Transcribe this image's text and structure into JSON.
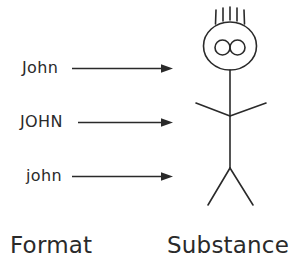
{
  "figure": {
    "title": "",
    "background_color": "#ffffff",
    "ink_color": "#2a2a2a",
    "format_column": {
      "axis_label": "Format",
      "entries": [
        {
          "text": "John",
          "style_note": "mixed-case"
        },
        {
          "text": "JOHN",
          "style_note": "upper-case"
        },
        {
          "text": "john",
          "style_note": "lower-case"
        }
      ]
    },
    "substance_column": {
      "axis_label": "Substance",
      "glyph": "stick-figure",
      "glyph_parts": [
        "head-circle",
        "eyes-double-circle",
        "hair-strands",
        "neck",
        "torso",
        "arms",
        "legs"
      ],
      "hair_strand_count": 5,
      "eye_count": 2
    },
    "arrows": {
      "count": 3,
      "direction": "left-to-right",
      "style": "solid-line-with-filled-arrowhead"
    }
  }
}
